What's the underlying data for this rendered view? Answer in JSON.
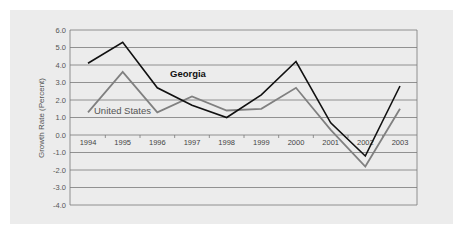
{
  "chart_data": {
    "type": "line",
    "title": "",
    "xlabel": "",
    "ylabel": "Growth Rate (Percent)",
    "categories": [
      "1994",
      "1995",
      "1996",
      "1997",
      "1998",
      "1999",
      "2000",
      "2001",
      "2002",
      "2003"
    ],
    "series": [
      {
        "name": "Georgia",
        "color": "#111111",
        "values": [
          4.1,
          5.3,
          2.7,
          1.7,
          1.0,
          2.3,
          4.2,
          0.7,
          -1.2,
          2.8
        ]
      },
      {
        "name": "United States",
        "color": "#808080",
        "values": [
          1.3,
          3.6,
          1.3,
          2.2,
          1.4,
          1.5,
          2.7,
          0.3,
          -1.8,
          1.5
        ]
      }
    ],
    "yticks": [
      "6.0",
      "5.0",
      "4.0",
      "3.0",
      "2.0",
      "1.0",
      "0.0",
      "-1.0",
      "-2.0",
      "-3.0",
      "-4.0"
    ],
    "ylim": [
      -4.0,
      6.0
    ],
    "grid": true,
    "legend": "inline labels"
  },
  "labels": {
    "georgia": "Georgia",
    "us": "United States",
    "ylabel": "Growth Rate (Percent)"
  }
}
